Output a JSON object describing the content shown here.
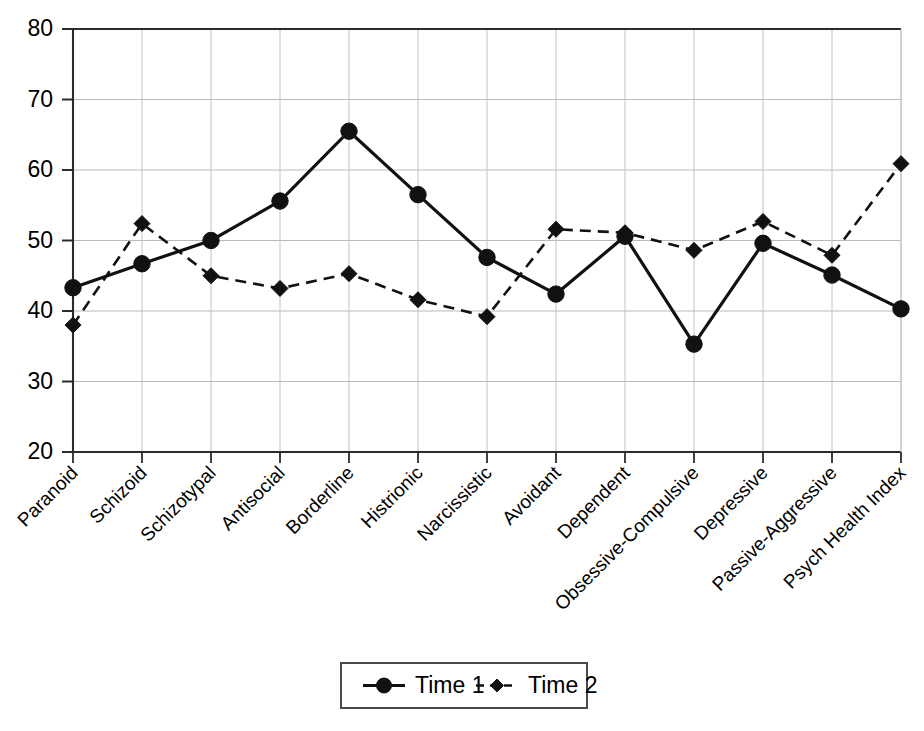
{
  "chart_data": {
    "type": "line",
    "title": "",
    "subtitle": "",
    "xlabel": "",
    "ylabel": "",
    "ylim": [
      20,
      80
    ],
    "yticks": [
      20,
      30,
      40,
      50,
      60,
      70,
      80
    ],
    "ytick_labels": [
      "20",
      "30",
      "40",
      "50",
      "60",
      "70",
      "80"
    ],
    "grid": true,
    "grid_axes": "both",
    "legend_position": "bottom-center",
    "categories": [
      "Paranoid",
      "Schizoid",
      "Schizotypal",
      "Antisocial",
      "Borderline",
      "Histrionic",
      "Narcissistic",
      "Avoidant",
      "Dependent",
      "Obsessive-Compulsive",
      "Depressive",
      "Passive-Aggressive",
      "Psych Health Index"
    ],
    "series": [
      {
        "name": "Time 1",
        "marker": "circle",
        "line_style": "solid",
        "color": "#111111",
        "values": [
          43.3,
          46.7,
          50.0,
          55.6,
          65.5,
          56.5,
          47.6,
          42.4,
          50.6,
          35.3,
          49.6,
          45.1,
          40.3
        ]
      },
      {
        "name": "Time 2",
        "marker": "diamond",
        "line_style": "dashed",
        "color": "#111111",
        "values": [
          38.0,
          52.4,
          45.0,
          43.2,
          45.3,
          41.6,
          39.2,
          51.6,
          51.1,
          48.6,
          52.7,
          47.9,
          60.9
        ]
      }
    ],
    "legend": [
      {
        "label": "Time 1",
        "marker": "circle",
        "line_style": "solid"
      },
      {
        "label": "Time 2",
        "marker": "diamond",
        "line_style": "dashed"
      }
    ]
  }
}
